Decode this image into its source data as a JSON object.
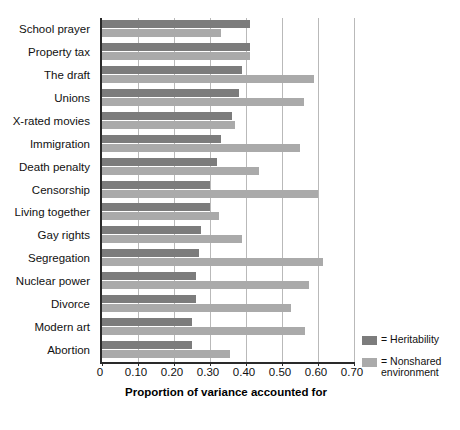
{
  "chart_data": {
    "type": "bar",
    "orientation": "horizontal",
    "title": "",
    "xlabel": "Proportion of variance accounted for",
    "ylabel": "",
    "xlim": [
      0,
      0.7
    ],
    "xticks": [
      0,
      0.1,
      0.2,
      0.3,
      0.4,
      0.5,
      0.6,
      0.7
    ],
    "xticklabels": [
      "0",
      "0.10",
      "0.20",
      "0.30",
      "0.40",
      "0.50",
      "0.60",
      "0.70"
    ],
    "grid": "vertical",
    "legend_position": "right",
    "categories": [
      "School prayer",
      "Property tax",
      "The draft",
      "Unions",
      "X-rated movies",
      "Immigration",
      "Death penalty",
      "Censorship",
      "Living together",
      "Gay rights",
      "Segregation",
      "Nuclear power",
      "Divorce",
      "Modern art",
      "Abortion"
    ],
    "series": [
      {
        "name": "Heritability",
        "color": "#7c7c7c",
        "values": [
          0.41,
          0.41,
          0.39,
          0.38,
          0.36,
          0.33,
          0.32,
          0.3,
          0.3,
          0.275,
          0.27,
          0.26,
          0.26,
          0.25,
          0.25
        ]
      },
      {
        "name": "Nonshared environment",
        "color": "#aaaaaa",
        "values": [
          0.33,
          0.41,
          0.59,
          0.56,
          0.37,
          0.55,
          0.435,
          0.6,
          0.325,
          0.39,
          0.615,
          0.575,
          0.525,
          0.565,
          0.355
        ]
      }
    ]
  },
  "legend": {
    "entries": [
      {
        "prefix": "= ",
        "label": "Heritability"
      },
      {
        "prefix": "= ",
        "label": "Nonshared\nenvironment"
      }
    ]
  }
}
